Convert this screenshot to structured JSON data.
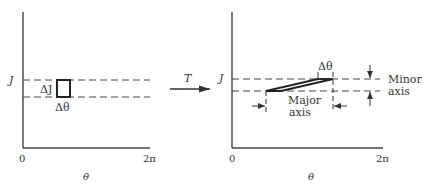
{
  "colors": {
    "ink": "#333333",
    "background": "#ffffff"
  },
  "left_panel": {
    "y_axis_label": "J",
    "x_axis_label": "θ",
    "x_tick_start": "0",
    "x_tick_end": "2π",
    "cell_height_label": "ΔJ",
    "cell_width_label": "Δθ"
  },
  "mapping_arrow": {
    "label": "T"
  },
  "right_panel": {
    "y_axis_label": "J",
    "x_axis_label": "θ",
    "x_tick_start": "0",
    "x_tick_end": "2π",
    "delta_theta_label": "Δθ",
    "major_axis_label_line1": "Major",
    "major_axis_label_line2": "axis",
    "minor_axis_label_line1": "Minor",
    "minor_axis_label_line2": "axis"
  }
}
